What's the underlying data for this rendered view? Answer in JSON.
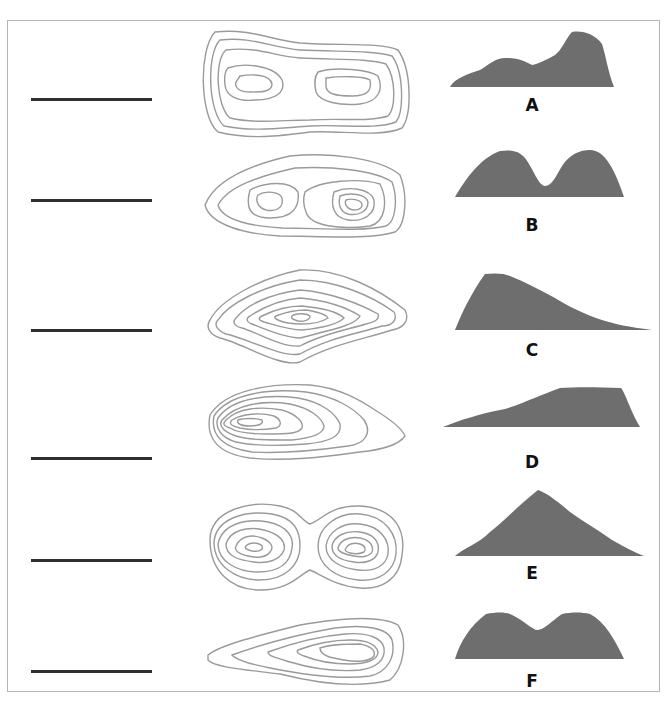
{
  "diagram": {
    "type": "matching-exercise",
    "colors": {
      "contour": "#9a9a9a",
      "profile_fill": "#6e6e6e",
      "answer_line": "#2e2e2e",
      "border": "#b5b5b5"
    },
    "rows": [
      {
        "answer_blank": "",
        "contour_id": 1,
        "profile_label": "A"
      },
      {
        "answer_blank": "",
        "contour_id": 2,
        "profile_label": "B"
      },
      {
        "answer_blank": "",
        "contour_id": 3,
        "profile_label": "C"
      },
      {
        "answer_blank": "",
        "contour_id": 4,
        "profile_label": "D"
      },
      {
        "answer_blank": "",
        "contour_id": 5,
        "profile_label": "E"
      },
      {
        "answer_blank": "",
        "contour_id": 6,
        "profile_label": "F"
      }
    ]
  }
}
